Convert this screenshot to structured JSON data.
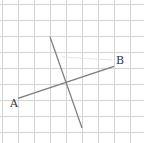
{
  "diagram": {
    "type": "geometry-grid",
    "grid": {
      "columns": 9,
      "rows": 9
    },
    "points": [
      {
        "id": "A",
        "label": "A",
        "grid": [
          1,
          5.9
        ]
      },
      {
        "id": "B",
        "label": "B",
        "grid": [
          7,
          3.9
        ]
      }
    ],
    "segments": [
      {
        "name": "segment-ab",
        "from": "A",
        "to": "B"
      },
      {
        "name": "perpendicular-bisector",
        "from_grid": [
          3,
          2.05
        ],
        "to_grid": [
          5,
          7.75
        ]
      }
    ],
    "colors": {
      "grid": "#d4d4d4",
      "segment": "#7a7a7a",
      "label": "#333333"
    }
  }
}
